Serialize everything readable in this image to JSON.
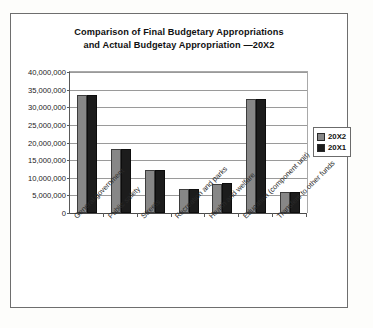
{
  "chart_data": {
    "type": "bar",
    "title": "Comparison of Final Budgetary Appropriations and Actual Budgetay Appropriation —20X2",
    "title_line1": "Comparison of Final Budgetary Appropriations",
    "title_line2": "and Actual Budgetay Appropriation —20X2",
    "xlabel": "",
    "ylabel": "",
    "ylim": [
      0,
      40000000
    ],
    "grid": true,
    "legend_position": "right",
    "categories": [
      "General government",
      "Public safety",
      "Streets",
      "Recreation and parks",
      "Health and welfare",
      "Education (component unit)",
      "Transfers to other funds"
    ],
    "ytick_labels": [
      "40,000,000",
      "35,000,000",
      "30,000,000",
      "25,000,000",
      "20,000,000",
      "15,000,000",
      "10,000,000",
      "5,000,000",
      "0"
    ],
    "ytick_values": [
      40000000,
      35000000,
      30000000,
      25000000,
      20000000,
      15000000,
      10000000,
      5000000,
      0
    ],
    "series": [
      {
        "name": "20X2",
        "color": "#878787",
        "values": [
          33500000,
          18200000,
          12200000,
          6800000,
          8300000,
          32300000,
          6000000
        ]
      },
      {
        "name": "20X1",
        "color": "#1c1c1c",
        "values": [
          33600000,
          18200000,
          12100000,
          6800000,
          8400000,
          32300000,
          6000000
        ]
      }
    ]
  }
}
